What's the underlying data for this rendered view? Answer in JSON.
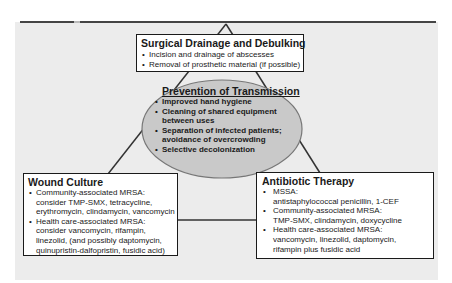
{
  "colors": {
    "panel_bg": "#ececec",
    "ellipse_fill": "#c9c9c9",
    "ellipse_stroke": "#777777",
    "line": "#333333",
    "box_border": "#1a1a1a"
  },
  "top_box": {
    "title": "Surgical Drainage and Debulking",
    "items": [
      {
        "line1": "Incision and drainage of abscesses"
      },
      {
        "line1": "Removal of prosthetic material (if possible)"
      }
    ]
  },
  "center_ellipse": {
    "title": "Prevention of Transmission",
    "items": [
      {
        "line1": "Improved hand hygiene",
        "line2": ""
      },
      {
        "line1": "Cleaning of shared equipment",
        "line2": "between uses"
      },
      {
        "line1": "Separation of infected patients;",
        "line2": "avoidance of overcrowding"
      },
      {
        "line1": "Selective decolonization",
        "line2": ""
      }
    ]
  },
  "left_box": {
    "title": "Wound Culture",
    "items": [
      {
        "line1": "Community-associated MRSA:",
        "line2": "consider TMP-SMX, tetracycline,",
        "line3": "erythromycin, clindamycin, vancomycin",
        "line4": ""
      },
      {
        "line1": "Health care-associated MRSA:",
        "line2": "consider vancomycin, rifampin,",
        "line3": "linezolid, (and possibly daptomycin,",
        "line4": "quinupristin-dalfopristin, fusidic acid)"
      }
    ]
  },
  "right_box": {
    "title": "Antibiotic Therapy",
    "items": [
      {
        "line1": "MSSA:",
        "line2": "antistaphylococcal penicillin, 1-CEF",
        "line3": ""
      },
      {
        "line1": "Community-associated MRSA:",
        "line2": "TMP-SMX, clindamycin, doxycycline",
        "line3": ""
      },
      {
        "line1": "Health care-associated MRSA:",
        "line2": "vancomycin, linezolid, daptomycin,",
        "line3": "rifampin plus fusidic acid"
      }
    ]
  }
}
